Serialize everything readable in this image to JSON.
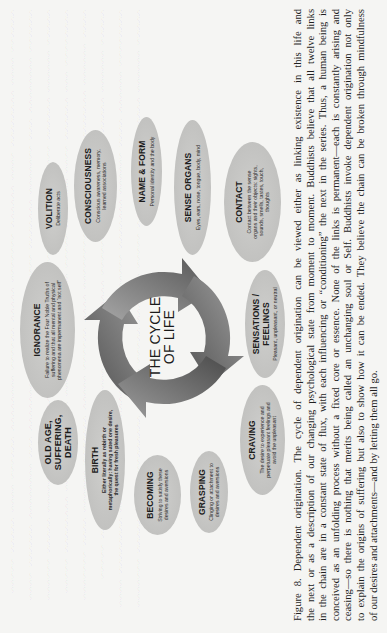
{
  "diagram": {
    "center_label_line1": "THE CYCLE",
    "center_label_line2": "OF LIFE",
    "nodes": [
      {
        "id": "volition",
        "title": "VOLITION",
        "desc": "Deliberate acts"
      },
      {
        "id": "consciousness",
        "title": "CONSCIOUSNESS",
        "desc": "Conscious awareness, memory, learned associations"
      },
      {
        "id": "name-form",
        "title": "NAME & FORM",
        "desc": "Personal identity and the body"
      },
      {
        "id": "sense-organs",
        "title": "SENSE ORGANS",
        "desc": "Eyes, ears, nose, tongue, body, mind"
      },
      {
        "id": "contact",
        "title": "CONTACT",
        "desc": "Contact between the sense organs and their objects: sights, sounds, smells, tastes, touch, thoughts"
      },
      {
        "id": "sensations",
        "title": "SENSATIONS / FEELINGS",
        "desc": "Pleasant, unpleasant, or neutral"
      },
      {
        "id": "craving",
        "title": "CRAVING",
        "desc": "The desire to experience and perpetuate pleasant feelings and avoid the unpleasant"
      },
      {
        "id": "grasping",
        "title": "GRASPING",
        "desc": "Clinging or attachment to desires and aversions"
      },
      {
        "id": "becoming",
        "title": "BECOMING",
        "desc": "Striving to satisfy these desires and aversions"
      },
      {
        "id": "birth",
        "title": "BIRTH",
        "desc": "Either literally as rebirth or metaphorically: having sated one desire, the quest for fresh pleasures"
      },
      {
        "id": "old-age",
        "title": "OLD AGE, SUFFERING, DEATH",
        "desc": ""
      },
      {
        "id": "ignorance",
        "title": "IGNORANCE",
        "desc": "Failure to realize the Four Noble Truths of suffering and that all mental and physical phenomena are impermanent and “not self”"
      }
    ]
  },
  "caption": {
    "lines": [
      "Figure 8. Dependent origination.  The cycle of dependent origination can be viewed either as linking existence in this life and",
      "the next or as a description of our changing psychological state from moment to moment. Buddhists believe that all twelve links",
      "in the chain are in a constant state of flux, with each influencing or “conditioning” the next in the series. Thus, a human being is",
      "conceived as an unfolding process without a fixed core or essence. None of the links is permanent—each is constantly arising and",
      "ceasing—so there is nothing that merits being called an unchanging soul or Self. Buddhists invoke dependent origination not only",
      "to explain the origins of suffering but also to show how it can be ended. They believe the chain can be broken through mindfulness",
      "of our desires and attachments—and by letting them all go."
    ]
  },
  "colors": {
    "page_background": "#f5f5f3",
    "node_fill": "#c4c4c2",
    "arrow_dark": "#5a5a5a",
    "arrow_light": "#bdbdbd",
    "text": "#1c1c1c"
  }
}
